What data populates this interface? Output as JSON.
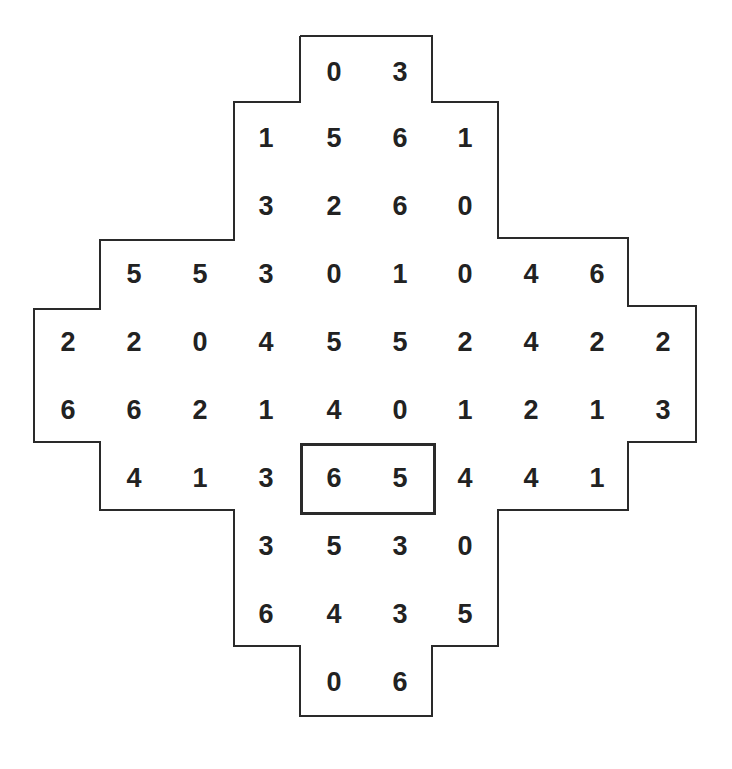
{
  "puzzle": {
    "type": "domino-grid",
    "stroke_color": "#2a2a2a",
    "text_color": "#222222",
    "rows": [
      {
        "y": 72,
        "cells": [
          {
            "col": 4,
            "value": "0"
          },
          {
            "col": 5,
            "value": "3"
          }
        ]
      },
      {
        "y": 138,
        "cells": [
          {
            "col": 3,
            "value": "1"
          },
          {
            "col": 4,
            "value": "5"
          },
          {
            "col": 5,
            "value": "6"
          },
          {
            "col": 6,
            "value": "1"
          }
        ]
      },
      {
        "y": 206,
        "cells": [
          {
            "col": 3,
            "value": "3"
          },
          {
            "col": 4,
            "value": "2"
          },
          {
            "col": 5,
            "value": "6"
          },
          {
            "col": 6,
            "value": "0"
          }
        ]
      },
      {
        "y": 274,
        "cells": [
          {
            "col": 1,
            "value": "5"
          },
          {
            "col": 2,
            "value": "5"
          },
          {
            "col": 3,
            "value": "3"
          },
          {
            "col": 4,
            "value": "0"
          },
          {
            "col": 5,
            "value": "1"
          },
          {
            "col": 6,
            "value": "0"
          },
          {
            "col": 7,
            "value": "4"
          },
          {
            "col": 8,
            "value": "6"
          }
        ]
      },
      {
        "y": 342,
        "cells": [
          {
            "col": 0,
            "value": "2"
          },
          {
            "col": 1,
            "value": "2"
          },
          {
            "col": 2,
            "value": "0"
          },
          {
            "col": 3,
            "value": "4"
          },
          {
            "col": 4,
            "value": "5"
          },
          {
            "col": 5,
            "value": "5"
          },
          {
            "col": 6,
            "value": "2"
          },
          {
            "col": 7,
            "value": "4"
          },
          {
            "col": 8,
            "value": "2"
          },
          {
            "col": 9,
            "value": "2"
          }
        ]
      },
      {
        "y": 410,
        "cells": [
          {
            "col": 0,
            "value": "6"
          },
          {
            "col": 1,
            "value": "6"
          },
          {
            "col": 2,
            "value": "2"
          },
          {
            "col": 3,
            "value": "1"
          },
          {
            "col": 4,
            "value": "4"
          },
          {
            "col": 5,
            "value": "0"
          },
          {
            "col": 6,
            "value": "1"
          },
          {
            "col": 7,
            "value": "2"
          },
          {
            "col": 8,
            "value": "1"
          },
          {
            "col": 9,
            "value": "3"
          }
        ]
      },
      {
        "y": 478,
        "cells": [
          {
            "col": 1,
            "value": "4"
          },
          {
            "col": 2,
            "value": "1"
          },
          {
            "col": 3,
            "value": "3"
          },
          {
            "col": 4,
            "value": "6"
          },
          {
            "col": 5,
            "value": "5"
          },
          {
            "col": 6,
            "value": "4"
          },
          {
            "col": 7,
            "value": "4"
          },
          {
            "col": 8,
            "value": "1"
          }
        ]
      },
      {
        "y": 546,
        "cells": [
          {
            "col": 3,
            "value": "3"
          },
          {
            "col": 4,
            "value": "5"
          },
          {
            "col": 5,
            "value": "3"
          },
          {
            "col": 6,
            "value": "0"
          }
        ]
      },
      {
        "y": 614,
        "cells": [
          {
            "col": 3,
            "value": "6"
          },
          {
            "col": 4,
            "value": "4"
          },
          {
            "col": 5,
            "value": "3"
          },
          {
            "col": 6,
            "value": "5"
          }
        ]
      },
      {
        "y": 682,
        "cells": [
          {
            "col": 4,
            "value": "0"
          },
          {
            "col": 5,
            "value": "6"
          }
        ]
      }
    ],
    "column_x": [
      68,
      134,
      200,
      266,
      334,
      400,
      465,
      531,
      597,
      663
    ],
    "highlighted_domino": {
      "row": 6,
      "cols": [
        4,
        5
      ],
      "values": [
        "6",
        "5"
      ]
    }
  }
}
